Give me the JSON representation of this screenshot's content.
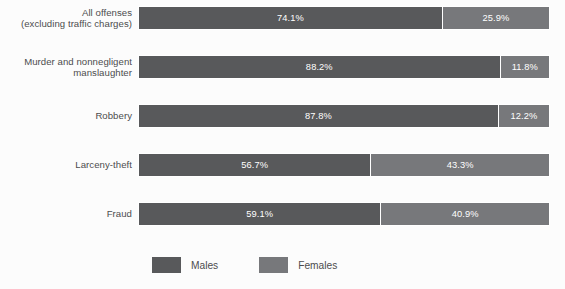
{
  "chart_data": {
    "type": "bar",
    "orientation": "horizontal",
    "stacked": true,
    "stack_total": 100,
    "title": "",
    "subtitle": "",
    "xlabel": "",
    "ylabel": "",
    "xlim": [
      0,
      100
    ],
    "grid": false,
    "legend_position": "bottom",
    "value_suffix": "%",
    "categories": [
      "All offenses\n(excluding traffic charges)",
      "Murder and nonnegligent\nmanslaughter",
      "Robbery",
      "Larceny-theft",
      "Fraud"
    ],
    "series": [
      {
        "name": "Males",
        "color": "#58595b",
        "values": [
          74.1,
          88.2,
          87.8,
          56.7,
          59.1
        ]
      },
      {
        "name": "Females",
        "color": "#77787b",
        "values": [
          25.9,
          11.8,
          12.2,
          43.3,
          40.9
        ]
      }
    ],
    "bars": [
      {
        "category_line1": "All offenses",
        "category_line2": "(excluding traffic charges)",
        "males_value": 74.1,
        "females_value": 25.9,
        "males_label": "74.1%",
        "females_label": "25.9%"
      },
      {
        "category_line1": "Murder and nonnegligent",
        "category_line2": "manslaughter",
        "males_value": 88.2,
        "females_value": 11.8,
        "males_label": "88.2%",
        "females_label": "11.8%"
      },
      {
        "category_line1": "Robbery",
        "category_line2": "",
        "males_value": 87.8,
        "females_value": 12.2,
        "males_label": "87.8%",
        "females_label": "12.2%"
      },
      {
        "category_line1": "Larceny-theft",
        "category_line2": "",
        "males_value": 56.7,
        "females_value": 43.3,
        "males_label": "56.7%",
        "females_label": "43.3%"
      },
      {
        "category_line1": "Fraud",
        "category_line2": "",
        "males_value": 59.1,
        "females_value": 40.9,
        "males_label": "59.1%",
        "females_label": "40.9%"
      }
    ],
    "legend": [
      {
        "label": "Males",
        "color": "#58595b"
      },
      {
        "label": "Females",
        "color": "#77787b"
      }
    ]
  },
  "colors": {
    "background": "#fcfcfc",
    "males": "#58595b",
    "females": "#77787b",
    "label_text": "#4c4c4e",
    "value_text": "#ffffff",
    "divider": "#ffffff"
  }
}
